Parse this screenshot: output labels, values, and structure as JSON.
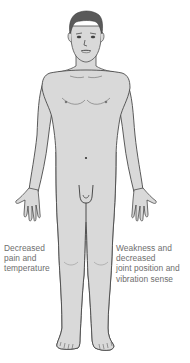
{
  "diagram": {
    "regions": [
      {
        "name": "upper-body",
        "fill": "#d8d8d8",
        "description": "unaffected"
      },
      {
        "name": "lower-body-left",
        "fill": "#a9a9a9",
        "description": "figure's right side below waist (viewer's left)"
      },
      {
        "name": "lower-body-right",
        "fill": "#bfbfbf",
        "description": "figure's left side below waist (viewer's right)"
      }
    ],
    "colors": {
      "skin": "#d9d9d9",
      "outline": "#4a4a4a",
      "hair": "#5a5a5a",
      "shade_dark": "#a9a9a9",
      "shade_light": "#bfbfbf",
      "label_text": "#6e6e6e"
    }
  },
  "labels": {
    "left": {
      "lines": [
        "Decreased",
        "pain and",
        "temperature"
      ]
    },
    "right": {
      "lines": [
        "Weakness and",
        "decreased",
        "joint position and",
        "vibration sense"
      ]
    }
  }
}
